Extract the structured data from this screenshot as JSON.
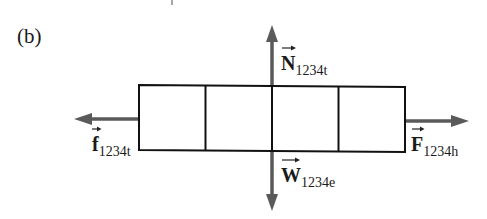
{
  "figure": {
    "panel_label": "(b)",
    "colors": {
      "box_stroke": "#111111",
      "arrow": "#5a5a5a",
      "text": "#1a1a1a",
      "background": "#ffffff"
    },
    "box": {
      "segments": 4,
      "description": "block divided into 4 equal sections"
    },
    "forces": [
      {
        "symbol": "N",
        "subscript": "1234t",
        "direction": "up",
        "name": "normal force"
      },
      {
        "symbol": "W",
        "subscript": "1234e",
        "direction": "down",
        "name": "weight"
      },
      {
        "symbol": "f",
        "subscript": "1234t",
        "direction": "left",
        "name": "friction force"
      },
      {
        "symbol": "F",
        "subscript": "1234h",
        "direction": "right",
        "name": "applied force"
      }
    ]
  }
}
